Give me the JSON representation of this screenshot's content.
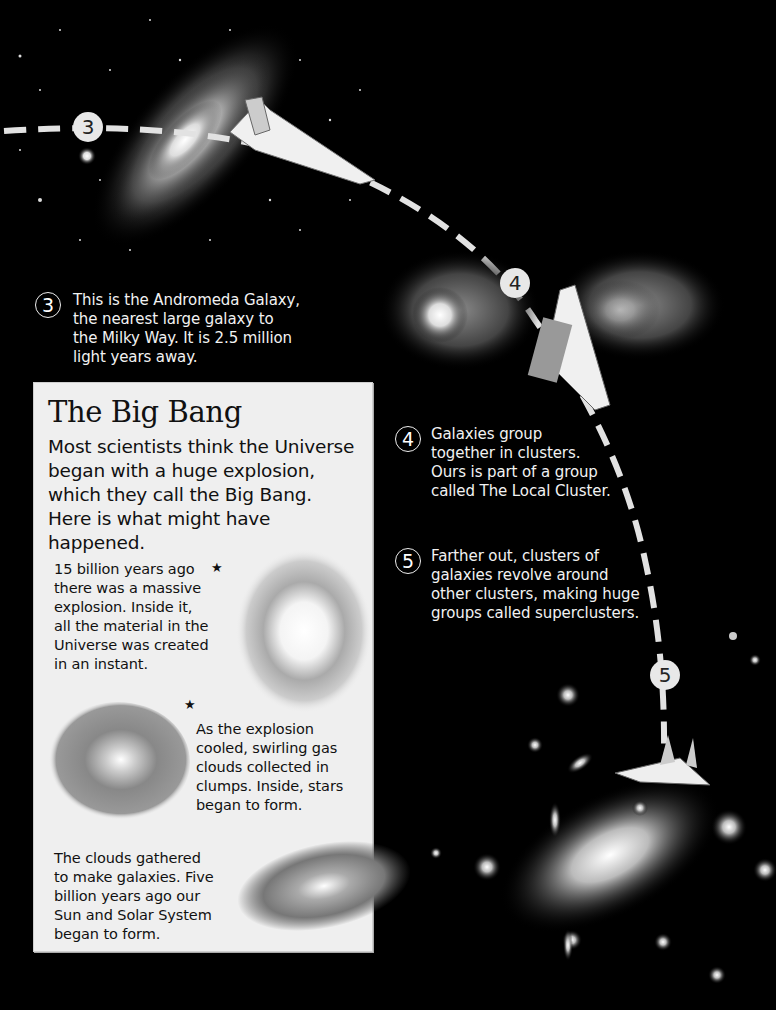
{
  "captions": [
    {
      "number": "3",
      "text": "This is the Andromeda Galaxy,\nthe nearest large galaxy to\nthe Milky Way. It is 2.5 million\nlight years away."
    },
    {
      "number": "4",
      "text": "Galaxies group\ntogether in clusters.\nOurs is part of a group\ncalled The Local Cluster."
    },
    {
      "number": "5",
      "text": "Farther out, clusters  of\ngalaxies revolve around\nother clusters, making huge\ngroups called superclusters."
    }
  ],
  "path_markers": [
    "3",
    "4",
    "5"
  ],
  "panel": {
    "title": "The Big Bang",
    "intro": "Most scientists think the Universe\nbegan with a huge explosion,\nwhich they call the Big Bang.\nHere is what might have\nhappened.",
    "steps": [
      {
        "text": "15 billion years ago\nthere was a massive\nexplosion. Inside it,\nall the material in the\nUniverse was created\nin an instant.",
        "image": "explosion-burst"
      },
      {
        "text": "As the explosion\ncooled, swirling gas\nclouds collected in\nclumps. Inside, stars\nbegan to form.",
        "image": "swirling-gas-cloud"
      },
      {
        "text": "The clouds gathered\nto make galaxies. Five\nbillion years ago our\nSun and Solar System\nbegan to form.",
        "image": "spiral-galaxy"
      }
    ],
    "star_glyph": "★"
  },
  "illustrations": [
    "andromeda-galaxy",
    "spaceship",
    "colliding-galaxies",
    "galaxy-supercluster"
  ]
}
